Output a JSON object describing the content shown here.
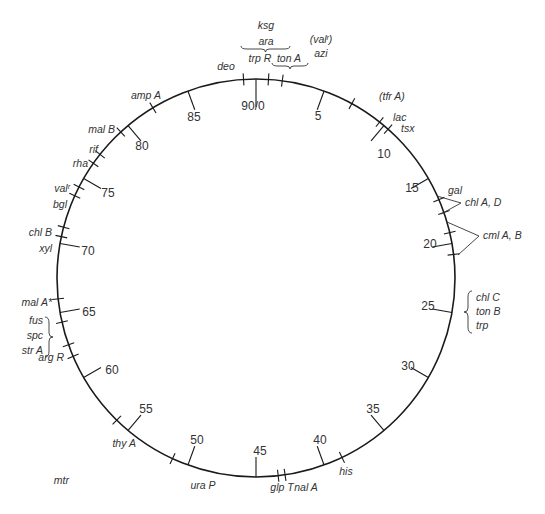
{
  "diagram": {
    "type": "circular genetic map",
    "total_units": 90,
    "origin_label": "90/0",
    "colors": {
      "line": "#1a1a1a",
      "text": "#333333",
      "background": "#ffffff"
    },
    "geometry": {
      "cx": 256,
      "cy": 278,
      "r": 199
    }
  },
  "scale_marks": [
    {
      "pos": 0,
      "label": "90/0",
      "lx": 253,
      "ly": 110,
      "tick": "in"
    },
    {
      "pos": 5,
      "label": "5",
      "lx": 318,
      "ly": 120,
      "tick": "in"
    },
    {
      "pos": 10,
      "label": "10",
      "lx": 384,
      "ly": 158,
      "tick": "in"
    },
    {
      "pos": 15,
      "label": "15",
      "lx": 412,
      "ly": 192,
      "tick": "in"
    },
    {
      "pos": 20,
      "label": "20",
      "lx": 430,
      "ly": 248,
      "tick": "in"
    },
    {
      "pos": 25,
      "label": "25",
      "lx": 428,
      "ly": 310,
      "tick": "in"
    },
    {
      "pos": 30,
      "label": "30",
      "lx": 408,
      "ly": 370,
      "tick": "in"
    },
    {
      "pos": 35,
      "label": "35",
      "lx": 373,
      "ly": 413,
      "tick": "in"
    },
    {
      "pos": 40,
      "label": "40",
      "lx": 320,
      "ly": 444,
      "tick": "in"
    },
    {
      "pos": 45,
      "label": "45",
      "lx": 260,
      "ly": 455,
      "tick": "in"
    },
    {
      "pos": 50,
      "label": "50",
      "lx": 197,
      "ly": 444,
      "tick": "in"
    },
    {
      "pos": 55,
      "label": "55",
      "lx": 146,
      "ly": 413,
      "tick": "in"
    },
    {
      "pos": 60,
      "label": "60",
      "lx": 112,
      "ly": 374,
      "tick": "in"
    },
    {
      "pos": 65,
      "label": "65",
      "lx": 89,
      "ly": 316,
      "tick": "in"
    },
    {
      "pos": 70,
      "label": "70",
      "lx": 88,
      "ly": 255,
      "tick": "in"
    },
    {
      "pos": 75,
      "label": "75",
      "lx": 108,
      "ly": 197,
      "tick": "in"
    },
    {
      "pos": 80,
      "label": "80",
      "lx": 142,
      "ly": 150,
      "tick": "in"
    },
    {
      "pos": 85,
      "label": "85",
      "lx": 194,
      "ly": 121,
      "tick": "in"
    }
  ],
  "gene_markers": [
    {
      "name": "deo",
      "pos": 89.1,
      "lx": 226,
      "ly": 70,
      "anchor": "middle"
    },
    {
      "name": "trp R",
      "pos": 0.9,
      "lx": 260,
      "ly": 62,
      "anchor": "middle"
    },
    {
      "name": "ton A",
      "pos": 1.9,
      "lx": 289,
      "ly": 62,
      "anchor": "middle"
    },
    {
      "name": "(tfr A)",
      "pos": 7.2,
      "lx": 379,
      "ly": 100,
      "anchor": "start"
    },
    {
      "name": "lac",
      "pos": 9.6,
      "lx": 393,
      "ly": 121,
      "anchor": "start"
    },
    {
      "name": "tsx",
      "pos": 10.4,
      "lx": 401,
      "ly": 132,
      "anchor": "start"
    },
    {
      "name": "gal",
      "pos": 16.7,
      "lx": 448,
      "ly": 194,
      "anchor": "start"
    },
    {
      "name": "",
      "pos": 17.7,
      "lx": 0,
      "ly": 0,
      "anchor": "start"
    },
    {
      "name": "",
      "pos": 19.2,
      "lx": 0,
      "ly": 0,
      "anchor": "start"
    },
    {
      "name": "",
      "pos": 20.8,
      "lx": 0,
      "ly": 0,
      "anchor": "start"
    },
    {
      "name": "his",
      "pos": 38.6,
      "lx": 346,
      "ly": 475,
      "anchor": "middle"
    },
    {
      "name": "nal A",
      "pos": 42.9,
      "lx": 306,
      "ly": 491,
      "anchor": "middle"
    },
    {
      "name": "glp T",
      "pos": 43.4,
      "lx": 282,
      "ly": 491,
      "anchor": "middle"
    },
    {
      "name": "ura P",
      "pos": 51.2,
      "lx": 203,
      "ly": 489,
      "anchor": "middle"
    },
    {
      "name": "thy A",
      "pos": 56.1,
      "lx": 136,
      "ly": 447,
      "anchor": "end"
    },
    {
      "name": "mtr",
      "pos": 61.7,
      "lx": 69,
      "ly": 484,
      "anchor": "end"
    },
    {
      "name": "arg R",
      "pos": 62.6,
      "lx": 64,
      "ly": 361,
      "anchor": "end"
    },
    {
      "name": "mal A*",
      "pos": 66.0,
      "lx": 52,
      "ly": 306,
      "anchor": "end"
    },
    {
      "name": "",
      "pos": 64.3,
      "lx": 0,
      "ly": 0,
      "anchor": "end"
    },
    {
      "name": "xyl",
      "pos": 70.5,
      "lx": 52,
      "ly": 252,
      "anchor": "end"
    },
    {
      "name": "chl B",
      "pos": 71.2,
      "lx": 52,
      "ly": 236,
      "anchor": "end"
    },
    {
      "name": "bgl",
      "pos": 73.6,
      "lx": 67,
      "ly": 208,
      "anchor": "end"
    },
    {
      "name": "valʳ",
      "pos": 74.3,
      "lx": 70,
      "ly": 192,
      "anchor": "end"
    },
    {
      "name": "rha",
      "pos": 76.3,
      "lx": 88,
      "ly": 167,
      "anchor": "end"
    },
    {
      "name": "rif",
      "pos": 77.1,
      "lx": 98,
      "ly": 153,
      "anchor": "end"
    },
    {
      "name": "mal B",
      "pos": 79.3,
      "lx": 115,
      "ly": 133,
      "anchor": "end"
    },
    {
      "name": "amp A",
      "pos": 82.2,
      "lx": 146,
      "ly": 99,
      "anchor": "middle"
    }
  ],
  "grouped_labels": [
    {
      "id": "ksg-ara",
      "lines": [
        "ksg",
        "ara"
      ],
      "x": 266,
      "y": [
        29,
        45
      ],
      "brace": "under",
      "brace_x": [
        241,
        290
      ],
      "brace_y": 49
    },
    {
      "id": "valr-azi",
      "lines": [
        "(valʳ)",
        "azi"
      ],
      "x": 321,
      "y": [
        43,
        57
      ],
      "brace": "none"
    },
    {
      "id": "tonA-brace",
      "lines": [],
      "brace": "under",
      "brace_x": [
        272,
        308
      ],
      "brace_y": 66
    },
    {
      "id": "chlAD",
      "lines": [
        "chl A, D"
      ],
      "x": 465,
      "y": [
        206
      ],
      "bracket_from": [
        [
          437,
          196
        ],
        [
          461,
          203
        ],
        [
          441,
          214
        ]
      ]
    },
    {
      "id": "cmlAB",
      "lines": [
        "cml A, B"
      ],
      "x": 483,
      "y": [
        239
      ],
      "bracket_from": [
        [
          447,
          222
        ],
        [
          479,
          236
        ],
        [
          458,
          255
        ]
      ]
    },
    {
      "id": "chlC-tonB-trp",
      "lines": [
        "chl C",
        "ton B",
        "trp"
      ],
      "x": 476,
      "y": [
        301,
        315,
        329
      ],
      "brace": "left",
      "brace_x": 468,
      "brace_y": [
        291,
        333
      ]
    },
    {
      "id": "fus-spc-strA",
      "lines": [
        "fus",
        "spc",
        "str A"
      ],
      "x": 43,
      "y": [
        324,
        339,
        354
      ],
      "brace": "right",
      "brace_x": 49,
      "brace_y": [
        317,
        357
      ]
    }
  ]
}
